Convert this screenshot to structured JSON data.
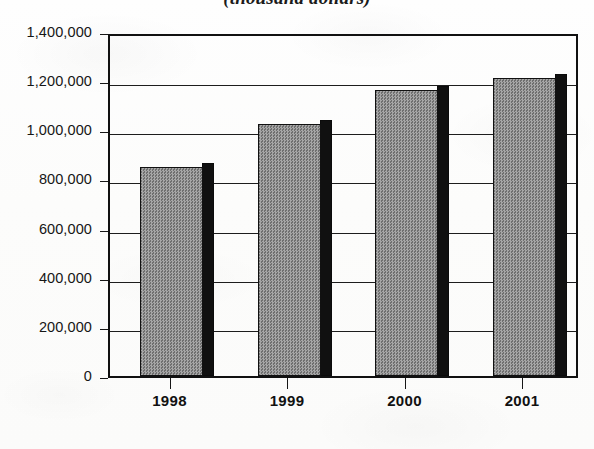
{
  "chart_data": {
    "type": "bar",
    "title": "(thousand dollars)",
    "title_clipped": true,
    "xlabel": "",
    "ylabel": "",
    "categories": [
      "1998",
      "1999",
      "2000",
      "2001"
    ],
    "values": [
      850000,
      1025000,
      1165000,
      1212000
    ],
    "series": [
      {
        "name": "value",
        "values": [
          850000,
          1025000,
          1165000,
          1212000
        ]
      }
    ],
    "ylim": [
      0,
      1400000
    ],
    "ytick_values": [
      0,
      200000,
      400000,
      600000,
      800000,
      1000000,
      1200000,
      1400000
    ],
    "ytick_labels": [
      "0",
      "200,000",
      "400,000",
      "600,000",
      "800,000",
      "1,000,000",
      "1,200,000",
      "1,400,000"
    ],
    "grid": true,
    "grid_axis": "y",
    "legend": false,
    "legend_position": "none",
    "bar_style": "3d-shadow",
    "bar_fill_color": "#8e8e8e",
    "bar_shadow_color": "#101010",
    "axis_color": "#111111",
    "background_color": "#fdfdfc"
  },
  "axis": {
    "y_labels": [
      {
        "text": "1,400,000",
        "value": 1400000
      },
      {
        "text": "1,200,000",
        "value": 1200000
      },
      {
        "text": "1,000,000",
        "value": 1000000
      },
      {
        "text": "800,000",
        "value": 800000
      },
      {
        "text": "600,000",
        "value": 600000
      },
      {
        "text": "400,000",
        "value": 400000
      },
      {
        "text": "200,000",
        "value": 200000
      },
      {
        "text": "0",
        "value": 0
      }
    ],
    "x_labels": [
      {
        "text": "1998"
      },
      {
        "text": "1999"
      },
      {
        "text": "2000"
      },
      {
        "text": "2001"
      }
    ]
  }
}
